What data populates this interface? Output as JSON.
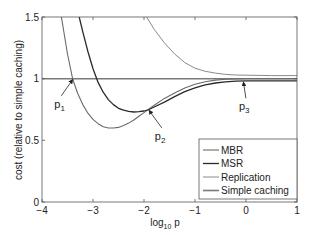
{
  "chart_data": {
    "type": "line",
    "title": "",
    "xlabel": "log10 p",
    "xlabel_main": "log",
    "xlabel_sub": "10",
    "xlabel_tail": " p",
    "ylabel": "cost (relative to simple caching)",
    "xlim": [
      -4,
      1
    ],
    "ylim": [
      0,
      1.5
    ],
    "xticks": [
      -4,
      -3,
      -2,
      -1,
      0,
      1
    ],
    "xtick_labels": [
      "−4",
      "−3",
      "−2",
      "−1",
      "0",
      "1"
    ],
    "yticks": [
      0,
      0.5,
      1,
      1.5
    ],
    "ytick_labels": [
      "0",
      "0.5",
      "1",
      "1.5"
    ],
    "grid": false,
    "legend_position": "lower right",
    "series": [
      {
        "name": "MBR",
        "color": "#6a6a6a",
        "width": 1.1,
        "x": [
          -3.62,
          -3.5,
          -3.4,
          -3.3,
          -3.2,
          -3.1,
          -3.0,
          -2.9,
          -2.8,
          -2.7,
          -2.6,
          -2.5,
          -2.4,
          -2.3,
          -2.2,
          -2.1,
          -2.0,
          -1.9,
          -1.8,
          -1.6,
          -1.4,
          -1.2,
          -1.0,
          -0.8,
          -0.6,
          -0.4,
          -0.2,
          0.0,
          0.5,
          1.0
        ],
        "values": [
          1.5,
          1.2,
          1.0,
          0.88,
          0.79,
          0.72,
          0.67,
          0.635,
          0.61,
          0.6,
          0.6,
          0.605,
          0.62,
          0.64,
          0.665,
          0.695,
          0.725,
          0.755,
          0.785,
          0.84,
          0.885,
          0.925,
          0.955,
          0.975,
          0.988,
          0.995,
          0.998,
          1.0,
          1.0,
          1.0
        ]
      },
      {
        "name": "MSR",
        "color": "#2a2a2a",
        "width": 1.3,
        "x": [
          -3.27,
          -3.2,
          -3.1,
          -3.0,
          -2.9,
          -2.8,
          -2.7,
          -2.6,
          -2.5,
          -2.4,
          -2.3,
          -2.2,
          -2.1,
          -2.0,
          -1.9,
          -1.8,
          -1.6,
          -1.4,
          -1.2,
          -1.0,
          -0.8,
          -0.6,
          -0.4,
          -0.2,
          0.0,
          0.5,
          1.0
        ],
        "values": [
          1.5,
          1.38,
          1.22,
          1.08,
          0.97,
          0.89,
          0.83,
          0.79,
          0.76,
          0.745,
          0.735,
          0.73,
          0.732,
          0.738,
          0.75,
          0.77,
          0.81,
          0.855,
          0.895,
          0.925,
          0.95,
          0.965,
          0.975,
          0.98,
          0.982,
          0.982,
          0.982
        ]
      },
      {
        "name": "Replication",
        "color": "#8a8a8a",
        "width": 1.0,
        "x": [
          -1.95,
          -1.8,
          -1.6,
          -1.4,
          -1.2,
          -1.0,
          -0.8,
          -0.6,
          -0.4,
          -0.2,
          0.0,
          0.5,
          1.0
        ],
        "values": [
          1.5,
          1.4,
          1.29,
          1.2,
          1.13,
          1.085,
          1.06,
          1.045,
          1.035,
          1.03,
          1.028,
          1.025,
          1.025
        ]
      },
      {
        "name": "Simple caching",
        "color": "#7a7a7a",
        "width": 1.6,
        "x": [
          -4,
          1
        ],
        "values": [
          1.0,
          1.0
        ]
      }
    ],
    "annotations": [
      {
        "label": "p",
        "sub": "1",
        "point": [
          -3.4,
          1.0
        ],
        "text_at": [
          -3.72,
          0.78
        ]
      },
      {
        "label": "p",
        "sub": "2",
        "point": [
          -1.9,
          0.75
        ],
        "text_at": [
          -1.75,
          0.52
        ]
      },
      {
        "label": "p",
        "sub": "3",
        "point": [
          -0.05,
          0.98
        ],
        "text_at": [
          -0.1,
          0.76
        ]
      }
    ]
  }
}
